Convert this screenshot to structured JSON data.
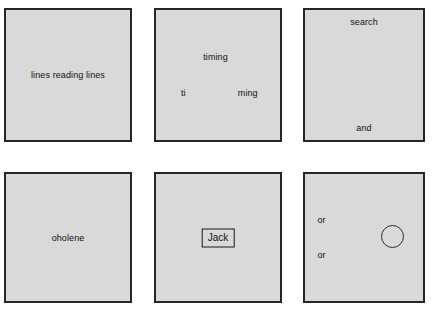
{
  "canvas": {
    "width": 440,
    "height": 316,
    "background_color": "#ffffff"
  },
  "style": {
    "panel_fill_color": "#d9d9d9",
    "panel_border_color": "#262626",
    "text_color": "#111111"
  },
  "panels": [
    {
      "id": "panel-1",
      "row": 1,
      "column": 1,
      "labels": [
        {
          "name": "panel-1-label",
          "text": "lines reading lines",
          "position": "center"
        }
      ]
    },
    {
      "id": "panel-2",
      "row": 1,
      "column": 2,
      "labels": [
        {
          "name": "panel-2-label-top",
          "text": "timing",
          "position": "upper-center"
        },
        {
          "name": "panel-2-label-left",
          "text": "ti",
          "position": "lower-left"
        },
        {
          "name": "panel-2-label-right",
          "text": "ming",
          "position": "lower-right"
        }
      ]
    },
    {
      "id": "panel-3",
      "row": 1,
      "column": 3,
      "labels": [
        {
          "name": "panel-3-label-top",
          "text": "search",
          "position": "top-center"
        },
        {
          "name": "panel-3-label-bottom",
          "text": "and",
          "position": "bottom-center"
        }
      ]
    },
    {
      "id": "panel-4",
      "row": 2,
      "column": 1,
      "labels": [
        {
          "name": "panel-4-label",
          "text": "oholene",
          "position": "center"
        }
      ]
    },
    {
      "id": "panel-5",
      "row": 2,
      "column": 2,
      "labels": [
        {
          "name": "panel-5-boxed-label",
          "text": "Jack",
          "position": "center",
          "boxed": true
        }
      ]
    },
    {
      "id": "panel-6",
      "row": 2,
      "column": 3,
      "labels": [
        {
          "name": "panel-6-label-first",
          "text": "or",
          "position": "upper-left"
        },
        {
          "name": "panel-6-label-second",
          "text": "or",
          "position": "lower-left"
        }
      ],
      "shapes": [
        {
          "name": "circle-outline",
          "type": "circle",
          "position": "center-right"
        }
      ]
    }
  ]
}
